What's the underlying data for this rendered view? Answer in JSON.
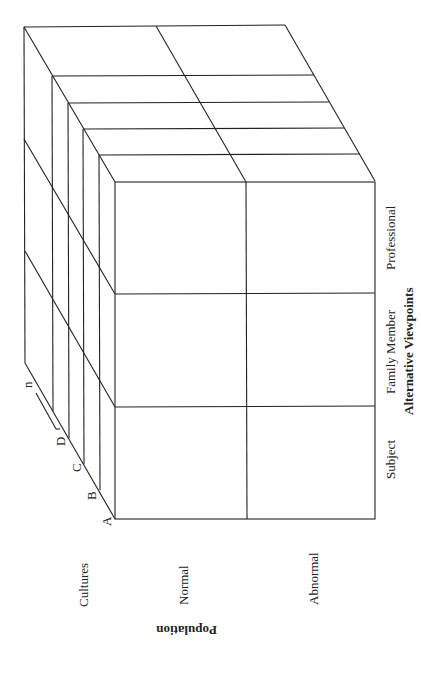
{
  "diagram": {
    "type": "3d-cube-matrix",
    "axes": {
      "viewpoints": {
        "title": "Alternative Viewpoints",
        "items": [
          "Subject",
          "Family Member",
          "Professional"
        ]
      },
      "population": {
        "title": "Population",
        "items": [
          "Normal",
          "Abnormal"
        ]
      },
      "cultures": {
        "title": "Cultures",
        "items": [
          "A",
          "B",
          "C",
          "D",
          "n"
        ]
      }
    }
  }
}
